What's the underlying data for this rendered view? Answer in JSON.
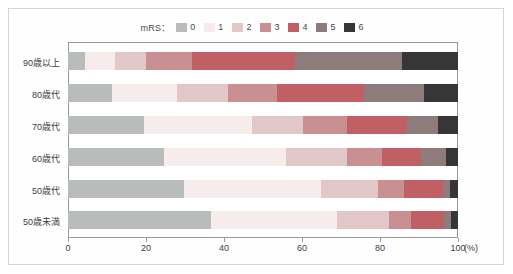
{
  "legend": {
    "title": "mRS：",
    "items": [
      {
        "label": "0",
        "color": "#b8bcbb"
      },
      {
        "label": "1",
        "color": "#f7ecec"
      },
      {
        "label": "2",
        "color": "#e1c7c8"
      },
      {
        "label": "3",
        "color": "#c98f92"
      },
      {
        "label": "4",
        "color": "#c05f64"
      },
      {
        "label": "5",
        "color": "#8e7c7d"
      },
      {
        "label": "6",
        "color": "#363636"
      }
    ]
  },
  "axes": {
    "x_tick_labels": [
      "0",
      "20",
      "40",
      "60",
      "80",
      "100"
    ],
    "x_unit": "(%)",
    "y_tick_labels": [
      "90歳以上",
      "80歳代",
      "70歳代",
      "60歳代",
      "50歳代",
      "50歳未満"
    ]
  },
  "chart_data": {
    "type": "bar",
    "orientation": "horizontal",
    "stacked": true,
    "normalized_percent": true,
    "title": "",
    "subtitle": "",
    "xlabel": "(%)",
    "ylabel": "",
    "xlim": [
      0,
      100
    ],
    "xticks": [
      0,
      20,
      40,
      60,
      80,
      100
    ],
    "grid": false,
    "legend_title": "mRS：",
    "legend_position": "top-center",
    "categories": [
      "90歳以上",
      "80歳代",
      "70歳代",
      "60歳代",
      "50歳代",
      "50歳未満"
    ],
    "series": [
      {
        "name": "0",
        "color": "#b8bcbb",
        "values": [
          4.3,
          11.2,
          19.5,
          24.7,
          29.8,
          36.6
        ]
      },
      {
        "name": "1",
        "color": "#f7ecec",
        "values": [
          7.7,
          16.7,
          27.8,
          31.3,
          35.2,
          32.4
        ]
      },
      {
        "name": "2",
        "color": "#e1c7c8",
        "values": [
          8.1,
          13.1,
          13.0,
          15.5,
          14.6,
          13.4
        ]
      },
      {
        "name": "3",
        "color": "#c98f92",
        "values": [
          11.6,
          12.5,
          11.3,
          9.1,
          6.6,
          5.6
        ]
      },
      {
        "name": "4",
        "color": "#c05f64",
        "values": [
          26.4,
          22.5,
          15.4,
          9.8,
          10.0,
          8.5
        ]
      },
      {
        "name": "5",
        "color": "#8e7c7d",
        "values": [
          27.5,
          15.3,
          7.9,
          6.6,
          1.8,
          1.7
        ]
      },
      {
        "name": "6",
        "color": "#363636",
        "values": [
          14.4,
          8.7,
          5.1,
          3.0,
          2.0,
          1.8
        ]
      }
    ],
    "cumulative_boundaries": {
      "90歳以上": [
        4.3,
        12.0,
        20.1,
        31.7,
        58.1,
        85.6,
        100
      ],
      "80歳代": [
        11.2,
        27.9,
        41.0,
        53.5,
        76.0,
        91.3,
        100
      ],
      "70歳代": [
        19.5,
        47.3,
        60.3,
        71.6,
        87.0,
        94.9,
        100
      ],
      "60歳代": [
        24.7,
        56.0,
        71.5,
        80.6,
        90.4,
        97.0,
        100
      ],
      "50歳代": [
        29.8,
        65.0,
        79.6,
        86.2,
        96.2,
        98.0,
        100
      ],
      "50歳未満": [
        36.6,
        69.0,
        82.4,
        88.0,
        96.5,
        98.2,
        100
      ]
    }
  }
}
